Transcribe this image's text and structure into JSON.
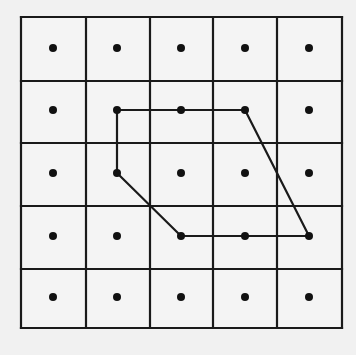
{
  "diagram": {
    "type": "dot-grid-polygon",
    "rows": 5,
    "cols": 5,
    "grid": {
      "x_lines": [
        21,
        86,
        150,
        213,
        277,
        342
      ],
      "y_lines": [
        17,
        81,
        143,
        206,
        269,
        328
      ]
    },
    "dot_centers": {
      "x": [
        53,
        117,
        181,
        245,
        309
      ],
      "y": [
        48,
        110,
        173,
        236,
        297
      ]
    },
    "polygon": {
      "description": "Closed polygon connecting grid dots",
      "vertices": [
        {
          "row": 1,
          "col": 1
        },
        {
          "row": 1,
          "col": 2
        },
        {
          "row": 1,
          "col": 3
        },
        {
          "row": 3,
          "col": 4
        },
        {
          "row": 3,
          "col": 3
        },
        {
          "row": 3,
          "col": 2
        },
        {
          "row": 2,
          "col": 1
        }
      ]
    },
    "colors": {
      "background": "#f1f1f1",
      "cell_fill": "#f4f4f4",
      "line": "#1a1a1a",
      "dot": "#111111"
    },
    "line_width": 2.2,
    "dot_radius": 4
  }
}
